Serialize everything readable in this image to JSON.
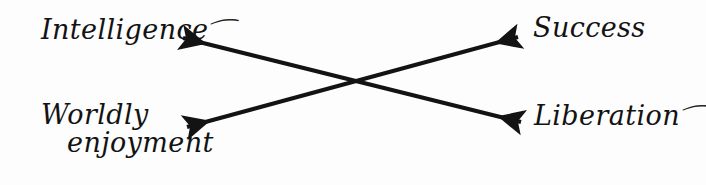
{
  "diagram": {
    "type": "crossing-double-arrows",
    "background_color": "#fdfdfd",
    "ink_color": "#131313",
    "nodes": {
      "top_left": {
        "text": "Intelligence",
        "swash": "⁀"
      },
      "top_right": {
        "text": "Success",
        "swash": ""
      },
      "bottom_left": {
        "text_line_1": "Worldly",
        "text_line_2": "enjoyment",
        "swash": ""
      },
      "bottom_right": {
        "text": "Liberation",
        "swash": "⁀"
      }
    },
    "arrows": [
      {
        "id": "intelligence-liberation",
        "from_label": "Intelligence",
        "to_label": "Liberation",
        "double_headed": true,
        "start": [
          183,
          38
        ],
        "end": [
          521,
          122
        ]
      },
      {
        "id": "worldly-success",
        "from_label": "Worldly enjoyment",
        "to_label": "Success",
        "double_headed": true,
        "start": [
          187,
          127
        ],
        "end": [
          518,
          37
        ]
      }
    ],
    "crossing_point": [
      352,
      82
    ]
  }
}
